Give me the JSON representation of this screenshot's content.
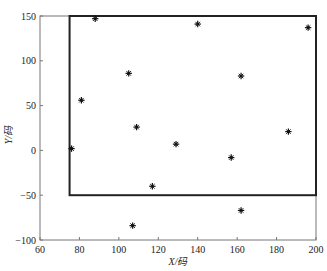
{
  "chart_data": {
    "type": "scatter",
    "title": "",
    "xlabel": "X/码",
    "ylabel": "Y/码",
    "xlim": [
      60,
      200
    ],
    "ylim": [
      -100,
      150
    ],
    "xticks": [
      60,
      80,
      100,
      120,
      140,
      160,
      180,
      200
    ],
    "yticks": [
      -100,
      -50,
      0,
      50,
      100,
      150
    ],
    "grid": false,
    "legend": null,
    "marker": "asterisk",
    "series": [
      {
        "name": "points",
        "color": "#111111",
        "points": [
          {
            "x": 88,
            "y": 147
          },
          {
            "x": 140,
            "y": 141
          },
          {
            "x": 196,
            "y": 137
          },
          {
            "x": 105,
            "y": 86
          },
          {
            "x": 162,
            "y": 83
          },
          {
            "x": 81,
            "y": 56
          },
          {
            "x": 109,
            "y": 26
          },
          {
            "x": 76,
            "y": 2
          },
          {
            "x": 129,
            "y": 7
          },
          {
            "x": 157,
            "y": -8
          },
          {
            "x": 186,
            "y": 21
          },
          {
            "x": 117,
            "y": -40
          },
          {
            "x": 162,
            "y": -67
          },
          {
            "x": 107,
            "y": -84
          }
        ]
      }
    ],
    "annotations": [
      {
        "type": "rectangle",
        "x0": 75,
        "y0": -50,
        "x1": 200,
        "y1": 150,
        "color": "#222222"
      }
    ]
  },
  "axes": {
    "x_label": "X/码",
    "y_label": "Y/码"
  }
}
